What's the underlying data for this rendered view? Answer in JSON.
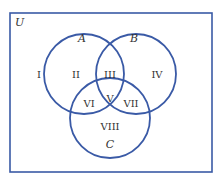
{
  "diagram": {
    "type": "venn",
    "colors": {
      "outline": "#3a5aa6",
      "text": "#333333",
      "background": "#ffffff"
    },
    "universe": {
      "label": "U",
      "rect": {
        "x": 10,
        "y": 13,
        "w": 202,
        "h": 159
      }
    },
    "sets": [
      {
        "name": "A",
        "label": "A",
        "cx": 84,
        "cy": 74,
        "r": 40,
        "label_x": 82,
        "label_y": 42
      },
      {
        "name": "B",
        "label": "B",
        "cx": 136,
        "cy": 74,
        "r": 40,
        "label_x": 134,
        "label_y": 42
      },
      {
        "name": "C",
        "label": "C",
        "cx": 110,
        "cy": 118,
        "r": 40,
        "label_x": 110,
        "label_y": 148
      }
    ],
    "regions": [
      {
        "id": "I",
        "label": "I",
        "x": 39,
        "y": 75
      },
      {
        "id": "II",
        "label": "II",
        "x": 76,
        "y": 75
      },
      {
        "id": "III",
        "label": "III",
        "x": 110,
        "y": 75
      },
      {
        "id": "IV",
        "label": "IV",
        "x": 157,
        "y": 75
      },
      {
        "id": "V",
        "label": "V",
        "x": 110,
        "y": 99
      },
      {
        "id": "VI",
        "label": "VI",
        "x": 89,
        "y": 104
      },
      {
        "id": "VII",
        "label": "VII",
        "x": 131,
        "y": 104
      },
      {
        "id": "VIII",
        "label": "VIII",
        "x": 110,
        "y": 127
      }
    ]
  }
}
